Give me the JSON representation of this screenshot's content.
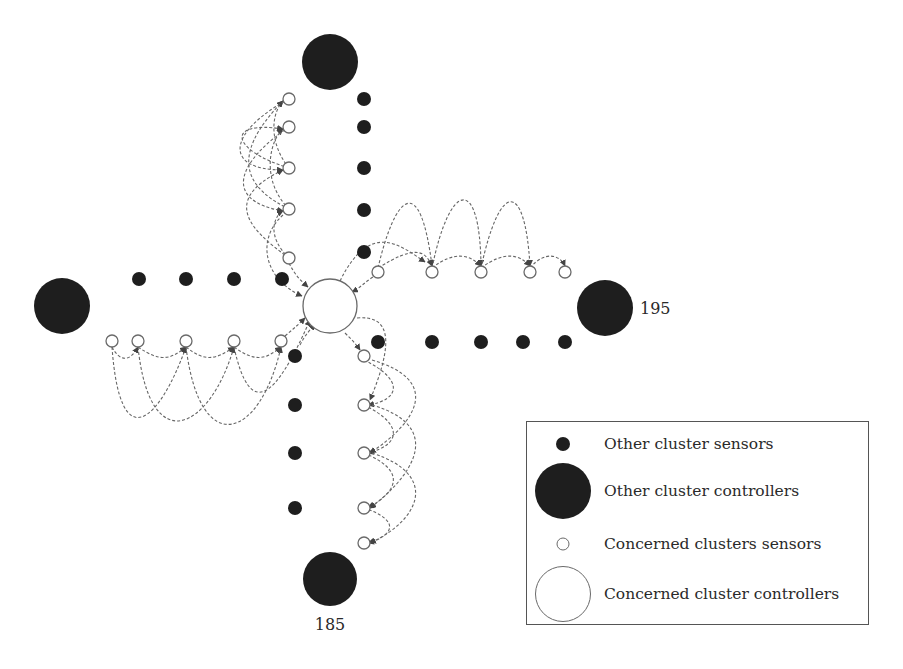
{
  "diagram": {
    "colors": {
      "filled": "#1e1e1e",
      "open_stroke": "#6a6a6a",
      "link": "#666666"
    },
    "concerned_controller": {
      "x": 330,
      "y": 306,
      "r": 27
    },
    "other_controllers": [
      {
        "id": "top",
        "x": 330,
        "y": 62,
        "r": 28,
        "label": ""
      },
      {
        "id": "left",
        "x": 62,
        "y": 306,
        "r": 28,
        "label": ""
      },
      {
        "id": "right",
        "x": 605,
        "y": 308,
        "r": 28,
        "label": "195"
      },
      {
        "id": "bottom",
        "x": 330,
        "y": 579,
        "r": 27,
        "label": "185"
      }
    ],
    "labels": {
      "right_controller": "195",
      "bottom_controller": "185"
    },
    "other_sensors": [
      [
        364,
        99
      ],
      [
        364,
        127
      ],
      [
        364,
        168
      ],
      [
        364,
        210
      ],
      [
        364,
        252
      ],
      [
        139,
        279
      ],
      [
        186,
        279
      ],
      [
        234,
        279
      ],
      [
        282,
        279
      ],
      [
        378,
        342
      ],
      [
        432,
        342
      ],
      [
        481,
        342
      ],
      [
        523,
        342
      ],
      [
        565,
        342
      ],
      [
        295,
        356
      ],
      [
        295,
        405
      ],
      [
        295,
        453
      ],
      [
        295,
        508
      ]
    ],
    "concerned_sensors": [
      [
        289,
        99
      ],
      [
        289,
        127
      ],
      [
        289,
        168
      ],
      [
        289,
        209
      ],
      [
        289,
        258
      ],
      [
        378,
        272
      ],
      [
        432,
        272
      ],
      [
        481,
        272
      ],
      [
        530,
        272
      ],
      [
        565,
        272
      ],
      [
        112,
        341
      ],
      [
        138,
        341
      ],
      [
        186,
        341
      ],
      [
        234,
        341
      ],
      [
        281,
        341
      ],
      [
        364,
        356
      ],
      [
        364,
        405
      ],
      [
        364,
        453
      ],
      [
        364,
        508
      ],
      [
        364,
        543
      ]
    ],
    "links": [
      "M289,209 C250,190 225,160 283,101",
      "M289,168 C230,150 225,120 283,129",
      "M289,258 C250,230 220,200 283,170",
      "M289,209 C260,180 270,140 283,129",
      "M289,168 C270,145 270,115 283,101",
      "M289,258 C265,235 275,215 283,211",
      "M289,127 C240,160 220,200 283,211",
      "M289,99 C230,130 220,170 283,170",
      "M283,215 C255,240 265,280 302,296",
      "M289,263 C295,275 300,280 308,287",
      "M378,268 C395,195 420,170 432,266",
      "M432,268 C450,180 480,175 481,266",
      "M481,268 C500,180 525,180 530,266",
      "M378,268 C415,245 425,250 432,266",
      "M432,268 C455,250 470,255 481,266",
      "M481,268 C505,250 520,255 530,266",
      "M530,268 C545,250 560,255 565,266",
      "M340,281 C370,220 400,245 425,262",
      "M373,277 C365,282 360,288 352,292",
      "M112,347 C120,460 160,420 186,347",
      "M138,347 C150,460 210,430 234,347",
      "M186,347 C200,460 260,440 281,347",
      "M234,347 C250,420 275,400 310,320",
      "M112,347 C120,362 130,362 138,347",
      "M138,347 C160,362 170,360 186,347",
      "M186,347 C205,362 215,360 234,347",
      "M234,347 C255,362 265,360 281,347",
      "M285,336 C292,330 298,325 305,318",
      "M300,345 C305,335 310,330 315,324",
      "M357,318 C390,315 395,340 370,400",
      "M364,360 C405,380 400,400 368,405",
      "M364,405 C405,425 400,445 368,453",
      "M364,453 C405,470 400,490 368,508",
      "M364,508 C400,520 395,535 368,543",
      "M372,360 C440,380 420,420 370,453",
      "M372,405 C440,425 420,470 370,508",
      "M372,453 C440,475 420,520 370,543",
      "M345,333 C352,340 356,344 360,350"
    ]
  },
  "legend": {
    "items": [
      {
        "symbol": "small-filled",
        "label": "Other cluster sensors"
      },
      {
        "symbol": "large-filled",
        "label": "Other cluster controllers"
      },
      {
        "symbol": "small-open",
        "label": "Concerned clusters sensors"
      },
      {
        "symbol": "large-open",
        "label": "Concerned cluster controllers"
      }
    ]
  }
}
